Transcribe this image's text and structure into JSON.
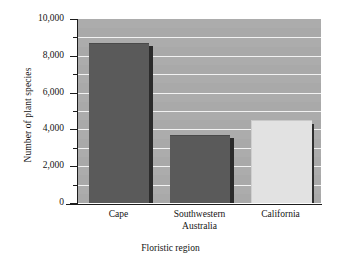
{
  "chart_data": {
    "type": "bar",
    "title": "",
    "categories": [
      "Cape",
      "Southwestern Australia",
      "California"
    ],
    "values": [
      8700,
      3700,
      4500
    ],
    "xlabel": "Floristic region",
    "ylabel": "Number of plant species",
    "ylim": [
      0,
      10000
    ],
    "ytick_labels": [
      "0",
      "2,000",
      "4,000",
      "6,000",
      "8,000",
      "10,000"
    ],
    "ytick_values": [
      0,
      2000,
      4000,
      6000,
      8000,
      10000
    ],
    "yminor_values": [
      1000,
      3000,
      5000,
      7000,
      9000
    ],
    "grid": "horizontal-white-lines-every-1000",
    "legend": "none",
    "plot_background_color": "#a9a9a9",
    "gridline_color": "#f2f2f2",
    "bar_colors": [
      "#5a5a5a",
      "#5a5a5a",
      "#e2e2e2"
    ],
    "bar_shadow_color": "#2b2b2b",
    "axis_color": "#1c1c1c",
    "figure_background_color": "#ffffff"
  },
  "axes": {
    "y_title": "Number of plant species",
    "x_title": "Floristic region",
    "y_ticks": [
      {
        "label": "10,000",
        "value": 10000
      },
      {
        "label": "8,000",
        "value": 8000
      },
      {
        "label": "6,000",
        "value": 6000
      },
      {
        "label": "4,000",
        "value": 4000
      },
      {
        "label": "2,000",
        "value": 2000
      },
      {
        "label": "0",
        "value": 0
      }
    ],
    "x_ticks": [
      {
        "line1": "Cape",
        "line2": ""
      },
      {
        "line1": "Southwestern",
        "line2": "Australia"
      },
      {
        "line1": "California",
        "line2": ""
      }
    ]
  }
}
